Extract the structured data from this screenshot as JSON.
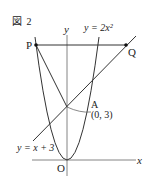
{
  "figure": {
    "title": "図 2",
    "axis_labels": {
      "x": "x",
      "y": "y"
    },
    "origin_label": "O",
    "curves": {
      "parabola": {
        "label": "y = 2x²",
        "equation": "y = 2x^2"
      },
      "line": {
        "label": "y = x + 3",
        "equation": "y = x + 3"
      }
    },
    "points": {
      "P": {
        "label": "P"
      },
      "Q": {
        "label": "Q"
      },
      "A": {
        "label": "A",
        "coords": "(0, 3)"
      }
    },
    "colors": {
      "stroke": "#333333",
      "axis": "#555555",
      "background": "#ffffff"
    }
  }
}
